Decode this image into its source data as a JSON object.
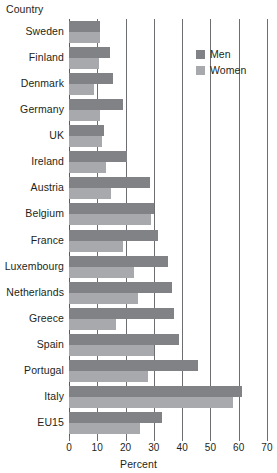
{
  "chart_data": {
    "type": "bar",
    "orientation": "horizontal",
    "title": "",
    "xlabel": "Percent",
    "ylabel": "Country",
    "xlim": [
      0,
      70
    ],
    "xticks": [
      0,
      10,
      20,
      30,
      40,
      50,
      60,
      70
    ],
    "grid": true,
    "legend_position": "top-right",
    "categories": [
      "Sweden",
      "Finland",
      "Denmark",
      "Germany",
      "UK",
      "Ireland",
      "Austria",
      "Belgium",
      "France",
      "Luxembourg",
      "Netherlands",
      "Greece",
      "Spain",
      "Portugal",
      "Italy",
      "EU15"
    ],
    "series": [
      {
        "name": "Men",
        "color": "#808285",
        "values": [
          11,
          14.5,
          15.5,
          19,
          12.5,
          20.5,
          28.5,
          30,
          31.5,
          35,
          36.5,
          37,
          39,
          45.5,
          61,
          33
        ]
      },
      {
        "name": "Women",
        "color": "#a7a9ac",
        "values": [
          11,
          10.5,
          9,
          11,
          11.5,
          13,
          15,
          29,
          19,
          23,
          24.5,
          16.5,
          30,
          28,
          58,
          25
        ]
      }
    ]
  },
  "axes": {
    "y_title": "Country",
    "x_title": "Percent",
    "x_tick_labels": [
      "0",
      "10",
      "20",
      "30",
      "40",
      "50",
      "60",
      "70"
    ]
  },
  "legend": {
    "items": [
      {
        "label": "Men",
        "swatch": "men"
      },
      {
        "label": "Women",
        "swatch": "women"
      }
    ]
  },
  "colors": {
    "men": "#808285",
    "women": "#a7a9ac",
    "gridline": "#6d6e71",
    "text": "#231f20"
  }
}
